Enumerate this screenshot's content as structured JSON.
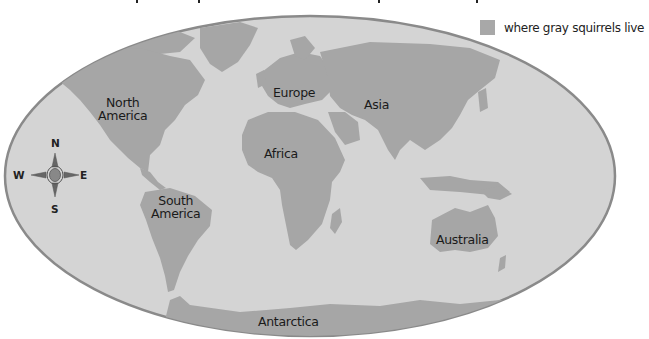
{
  "map": {
    "title_partially_visible": true,
    "colors": {
      "ocean": "#d4d4d4",
      "land": "#a6a6a6",
      "border": "#8a8a8a",
      "background": "#ffffff"
    },
    "continents": [
      {
        "id": "north-america",
        "label": "North America",
        "lines": [
          "North",
          "America"
        ]
      },
      {
        "id": "europe",
        "label": "Europe",
        "lines": [
          "Europe"
        ]
      },
      {
        "id": "asia",
        "label": "Asia",
        "lines": [
          "Asia"
        ]
      },
      {
        "id": "africa",
        "label": "Africa",
        "lines": [
          "Africa"
        ]
      },
      {
        "id": "south-america",
        "label": "South America",
        "lines": [
          "South",
          "America"
        ]
      },
      {
        "id": "australia",
        "label": "Australia",
        "lines": [
          "Australia"
        ]
      },
      {
        "id": "antarctica",
        "label": "Antarctica",
        "lines": [
          "Antarctica"
        ]
      }
    ]
  },
  "legend": {
    "swatch_color": "#a8a8a8",
    "text": "where gray squirrels live"
  },
  "compass": {
    "north": "N",
    "south": "S",
    "east": "E",
    "west": "W"
  }
}
